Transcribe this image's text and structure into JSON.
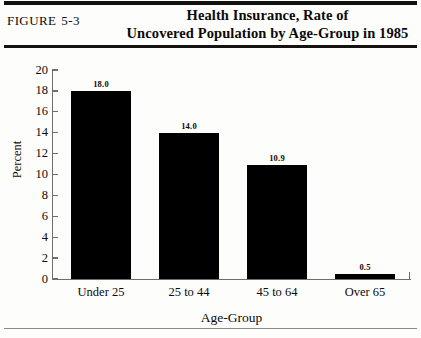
{
  "figure": {
    "label": "FIGURE",
    "number": "5-3"
  },
  "title": {
    "line1": "Health Insurance, Rate of",
    "line2": "Uncovered Population by Age-Group in 1985"
  },
  "chart_data": {
    "type": "bar",
    "title": "Health Insurance, Rate of Uncovered Population by Age-Group in 1985",
    "categories": [
      "Under 25",
      "25 to 44",
      "45 to 64",
      "Over 65"
    ],
    "values": [
      18.0,
      14.0,
      10.9,
      0.5
    ],
    "value_labels": [
      "18.0",
      "14.0",
      "10.9",
      "0.5"
    ],
    "xlabel": "Age-Group",
    "ylabel": "Percent",
    "ylim": [
      0,
      20
    ],
    "ytick_labels": [
      "20",
      "18",
      "16",
      "14",
      "12",
      "10",
      "8",
      "6",
      "4",
      "2",
      "0"
    ],
    "ytick_values": [
      20,
      18,
      16,
      14,
      12,
      10,
      8,
      6,
      4,
      2,
      0
    ],
    "grid": false,
    "legend": null,
    "bar_color": "#000000",
    "axis_color": "#6e6e6a",
    "background": "#fdfdfb"
  }
}
